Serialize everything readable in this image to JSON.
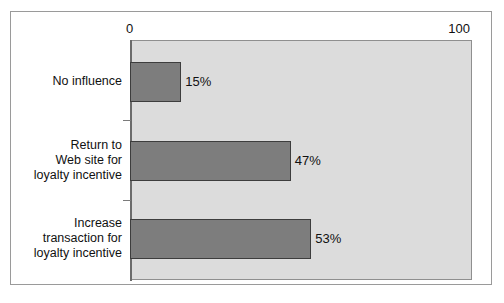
{
  "chart_data": {
    "type": "bar",
    "orientation": "horizontal",
    "title": "",
    "subtitle": "",
    "xlabel": "",
    "ylabel": "",
    "xlim": [
      0,
      100
    ],
    "xticks": [
      "0",
      "100"
    ],
    "grid": false,
    "legend": null,
    "categories": [
      "No influence",
      "Return to Web site for loyalty incentive",
      "Increase transaction for loyalty incentive"
    ],
    "category_lines": [
      [
        "No influence"
      ],
      [
        "Return to",
        "Web site for",
        "loyalty incentive"
      ],
      [
        "Increase",
        "transaction for",
        "loyalty incentive"
      ]
    ],
    "values": [
      15,
      47,
      53
    ],
    "value_labels": [
      "15%",
      "47%",
      "53%"
    ],
    "colors": {
      "bar_fill": "#7d7d7d",
      "bar_outline": "#3d3d3d",
      "plot_background": "#dcdcdc",
      "figure_background": "#ffffff",
      "frame_border": "#9a9a9a",
      "axis_line": "#6b6b6b",
      "text": "#111111"
    }
  },
  "axis": {
    "min_label": "0",
    "max_label": "100"
  }
}
